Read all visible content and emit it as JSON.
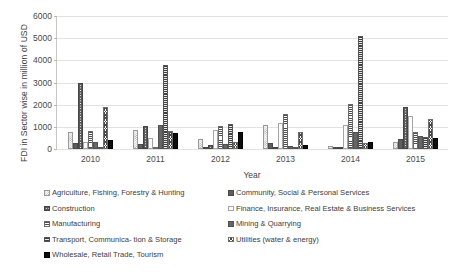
{
  "chart_data": {
    "type": "bar",
    "title": "",
    "xlabel": "Year",
    "ylabel": "FDI in Sector wise in million of USD",
    "categories": [
      "2010",
      "2011",
      "2012",
      "2013",
      "2014",
      "2015"
    ],
    "ylim": [
      0,
      6000
    ],
    "yticks": [
      0,
      1000,
      2000,
      3000,
      4000,
      5000,
      6000
    ],
    "ytick_labels": [
      "0",
      "1000",
      "2000",
      "3000",
      "4000",
      "5000",
      "6000"
    ],
    "grid": true,
    "legend_position": "bottom",
    "series": [
      {
        "name": "Agriculture, Fishing, Forestry & Hunting",
        "pattern": "light-dotted",
        "values": [
          770,
          880,
          430,
          1090,
          120,
          330
        ]
      },
      {
        "name": "Community, Social & Personal Services",
        "pattern": "solid-dark-grey",
        "values": [
          250,
          240,
          60,
          250,
          70,
          450
        ]
      },
      {
        "name": "Construction",
        "pattern": "dark-with-white-dots",
        "values": [
          2990,
          1040,
          170,
          110,
          60,
          1890
        ]
      },
      {
        "name": "Finance, Insurance, Real Estate & Business Services",
        "pattern": "white-outline",
        "values": [
          300,
          510,
          880,
          1160,
          1080,
          1500
        ]
      },
      {
        "name": "Manufacturing",
        "pattern": "horizontal-lines",
        "values": [
          820,
          70,
          1040,
          1580,
          2050,
          750
        ]
      },
      {
        "name": "Mining & Quarrying",
        "pattern": "solid-medium-grey",
        "values": [
          320,
          1100,
          220,
          120,
          780,
          570
        ]
      },
      {
        "name": "Transport, Communica- tion & Storage",
        "pattern": "horizontal-lines-dense",
        "values": [
          70,
          3780,
          1120,
          110,
          5090,
          560
        ]
      },
      {
        "name": "Utilities (water & energy)",
        "pattern": "checkerboard",
        "values": [
          1880,
          820,
          320,
          790,
          280,
          1370
        ]
      },
      {
        "name": "Wholesale, Retail Trade, Tourism",
        "pattern": "solid-black",
        "values": [
          390,
          740,
          760,
          170,
          300,
          490
        ]
      }
    ]
  },
  "legend": {
    "left_column": [
      "Agriculture, Fishing, Forestry & Hunting",
      "Construction",
      "Manufacturing",
      "Transport, Communica- tion & Storage",
      "Wholesale, Retail Trade, Tourism"
    ],
    "right_column": [
      "Community, Social & Personal Services",
      "Finance, Insurance, Real Estate & Business Services",
      "Mining & Quarrying",
      "Utilities (water & energy)"
    ]
  },
  "colors": {
    "text": "#3d3d3d",
    "axis": "#b8b8b8",
    "grid": "#e2e2e2",
    "bar_dark": "#5e5e5e",
    "bar_black": "#0d0d0d",
    "bar_white": "#fbfbfb"
  }
}
